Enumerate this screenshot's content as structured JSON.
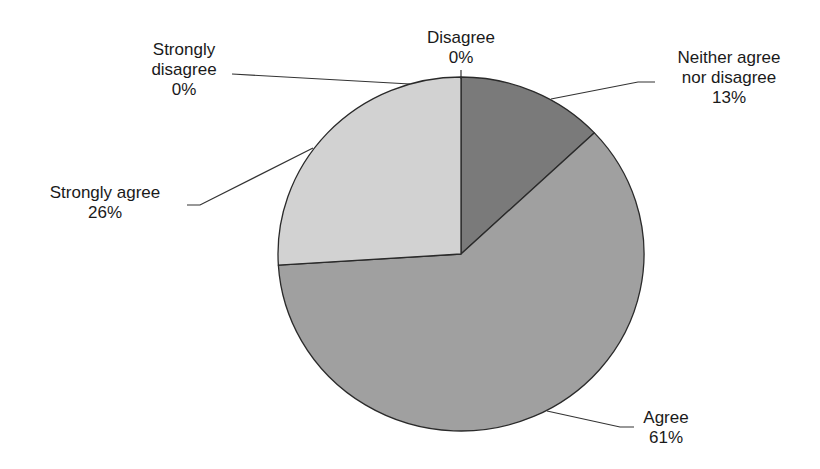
{
  "chart_data": {
    "type": "pie",
    "title": "",
    "start_angle_deg": 0,
    "direction": "clockwise",
    "slices": [
      {
        "label": "Neither agree nor disagree",
        "value": 13,
        "display": "13%",
        "color": "#7a7a7a"
      },
      {
        "label": "Agree",
        "value": 61,
        "display": "61%",
        "color": "#a0a0a0"
      },
      {
        "label": "Strongly agree",
        "value": 26,
        "display": "26%",
        "color": "#d2d2d2"
      },
      {
        "label": "Strongly disagree",
        "value": 0,
        "display": "0%",
        "color": "#d2d2d2"
      },
      {
        "label": "Disagree",
        "value": 0,
        "display": "0%",
        "color": "#7a7a7a"
      }
    ]
  },
  "labels": {
    "disagree": {
      "line1": "Disagree",
      "pct": "0%"
    },
    "neither": {
      "line1": "Neither agree",
      "line2": "nor disagree",
      "pct": "13%"
    },
    "strongly_disagree": {
      "line1": "Strongly",
      "line2": "disagree",
      "pct": "0%"
    },
    "strongly_agree": {
      "line1": "Strongly agree",
      "pct": "26%"
    },
    "agree": {
      "line1": "Agree",
      "pct": "61%"
    }
  }
}
